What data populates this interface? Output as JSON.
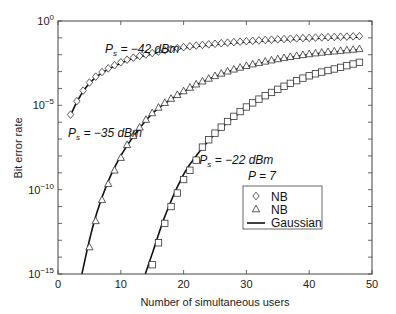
{
  "chart_data": {
    "type": "line",
    "title": "",
    "xlabel": "Number of simultaneous users",
    "ylabel": "Bit error rate",
    "xlim": [
      0,
      50
    ],
    "ylim_log10": [
      -15,
      0
    ],
    "yscale": "log",
    "x_ticks": [
      0,
      10,
      20,
      30,
      40,
      50
    ],
    "y_ticks_labeled": [
      {
        "exp": 0,
        "label_base": "10",
        "label_exp": "0"
      },
      {
        "exp": -5,
        "label_base": "10",
        "label_exp": "−5"
      },
      {
        "exp": -10,
        "label_base": "10",
        "label_exp": "−10"
      },
      {
        "exp": -15,
        "label_base": "10",
        "label_exp": "−15"
      }
    ],
    "y_minor_ticks_every_decade": true,
    "grid": false,
    "legend": {
      "title": "P = 7",
      "position": "lower-right inside",
      "entries": [
        {
          "marker": "diamond",
          "label": "NB"
        },
        {
          "marker": "triangle",
          "label": "NB"
        },
        {
          "marker": "line",
          "label": "Gaussian"
        }
      ]
    },
    "annotations": [
      {
        "text_main": "P",
        "text_sub": "s",
        "text_rest": " = −42 dBm",
        "x": 7.5,
        "log10_y": -1.9
      },
      {
        "text_main": "P",
        "text_sub": "s",
        "text_rest": " = −35 dBm",
        "x": 1.6,
        "log10_y": -6.9
      },
      {
        "text_main": "P",
        "text_sub": "s",
        "text_rest": " = −22 dBm",
        "x": 22.5,
        "log10_y": -8.5
      }
    ],
    "series": [
      {
        "name": "Ps = -42 dBm",
        "marker": "diamond",
        "gaussian_curve": {
          "x": [
            2,
            3,
            5,
            10,
            15,
            20,
            25,
            30,
            40,
            48
          ],
          "log10_y": [
            -5.6,
            -4.8,
            -3.7,
            -2.5,
            -1.95,
            -1.6,
            -1.4,
            -1.25,
            -1.05,
            -0.95
          ]
        },
        "nb_points_x_range": [
          2,
          48
        ]
      },
      {
        "name": "Ps = -35 dBm",
        "marker": "triangle",
        "gaussian_curve": {
          "x": [
            3.8,
            5,
            6,
            8,
            10,
            12,
            15,
            20,
            25,
            30,
            35,
            40,
            48
          ],
          "log10_y": [
            -15,
            -13.0,
            -11.6,
            -9.5,
            -8.0,
            -6.85,
            -5.5,
            -4.2,
            -3.3,
            -2.7,
            -2.3,
            -2.0,
            -1.7
          ]
        },
        "nb_points": {
          "x": [
            5,
            6,
            7,
            8,
            9,
            10
          ],
          "log10_y": [
            -13.4,
            -11.85,
            -10.6,
            -9.65,
            -8.85,
            -8.1
          ]
        },
        "nb_points_x_range": [
          5,
          48
        ]
      },
      {
        "name": "Ps = -22 dBm",
        "marker": "square",
        "gaussian_curve": {
          "x": [
            13.9,
            15,
            17,
            20,
            22,
            25,
            30,
            35,
            40,
            45,
            48
          ],
          "log10_y": [
            -15,
            -13.8,
            -11.6,
            -9.1,
            -8.0,
            -6.7,
            -5.15,
            -4.1,
            -3.3,
            -2.8,
            -2.5
          ]
        },
        "nb_points": {
          "x": [
            15,
            16,
            17,
            18,
            19,
            20,
            21,
            22
          ],
          "log10_y": [
            -14.45,
            -13.15,
            -12.0,
            -11.0,
            -10.2,
            -9.4,
            -8.85,
            -8.25
          ]
        },
        "nb_points_x_range": [
          15,
          48
        ]
      }
    ]
  }
}
